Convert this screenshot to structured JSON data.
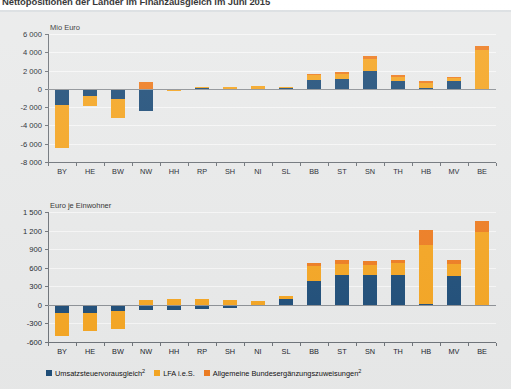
{
  "document": {
    "title": "Nettopositionen der Länder im Finanzausgleich im Juni 2015"
  },
  "legend": {
    "items": [
      {
        "label": "Umsatzsteuervorausgleich",
        "sup": "2",
        "color": "#1f4e79"
      },
      {
        "label": "LFA i.e.S.",
        "sup": "",
        "color": "#f5a623"
      },
      {
        "label": "Allgemeine Bundesergänzungszuweisungen",
        "sup": "2",
        "color": "#ee7d22"
      }
    ]
  },
  "colors": {
    "series_blue": "#1f4e79",
    "series_yellow": "#f5a623",
    "series_orange": "#ee7d22",
    "panel_bg": "#e9eaea",
    "grid": "#f7f7f7",
    "axis": "#6f747a",
    "zero": "#8d9196"
  },
  "chart_data": [
    {
      "id": "chart-mio-euro",
      "type": "bar",
      "stacked": true,
      "title": "",
      "subtitle": "Mio Euro",
      "ylabel": "Mio Euro",
      "xlabel": "",
      "grid": true,
      "legend_position": "bottom",
      "ylim": [
        -8000,
        6000
      ],
      "yticks": [
        6000,
        4000,
        2000,
        0,
        -2000,
        -4000,
        -6000,
        -8000
      ],
      "ytick_labels": [
        "6 000",
        "4 000",
        "2 000",
        "0",
        "-2 000",
        "-4 000",
        "-6 000",
        "-8 000"
      ],
      "categories": [
        "BY",
        "HE",
        "BW",
        "NW",
        "HH",
        "RP",
        "SH",
        "NI",
        "SL",
        "BB",
        "ST",
        "SN",
        "TH",
        "HB",
        "MV",
        "BE"
      ],
      "series": [
        {
          "name": "Umsatzsteuervorausgleich",
          "color": "#1f4e79",
          "values": [
            -1750,
            -750,
            -1100,
            -2450,
            -150,
            40,
            -40,
            -70,
            60,
            950,
            1050,
            1900,
            850,
            80,
            900,
            -20
          ]
        },
        {
          "name": "LFA i.e.S.",
          "color": "#f5a623",
          "values": [
            -4700,
            -1150,
            -2100,
            0,
            -130,
            200,
            190,
            280,
            190,
            520,
            600,
            1350,
            500,
            580,
            300,
            4200
          ]
        },
        {
          "name": "Allgemeine Bundesergänzungszuweisungen",
          "color": "#ee7d22",
          "values": [
            0,
            0,
            0,
            750,
            0,
            0,
            0,
            0,
            0,
            160,
            200,
            380,
            180,
            170,
            120,
            500
          ]
        }
      ]
    },
    {
      "id": "chart-euro-je-einwohner",
      "type": "bar",
      "stacked": true,
      "title": "",
      "subtitle": "Euro je Einwohner",
      "ylabel": "Euro je Einwohner",
      "xlabel": "",
      "grid": true,
      "legend_position": "bottom",
      "ylim": [
        -600,
        1500
      ],
      "yticks": [
        1500,
        1200,
        900,
        600,
        300,
        0,
        -300,
        -600
      ],
      "ytick_labels": [
        "1 500",
        "1 200",
        "900",
        "600",
        "300",
        "0",
        "-300",
        "-600"
      ],
      "categories": [
        "BY",
        "HE",
        "BW",
        "NW",
        "HH",
        "RP",
        "SH",
        "NI",
        "SL",
        "BB",
        "ST",
        "SN",
        "TH",
        "HB",
        "MV",
        "BE"
      ],
      "series": [
        {
          "name": "Umsatzsteuervorausgleich",
          "color": "#1f4e79",
          "values": [
            -135,
            -125,
            -105,
            -85,
            -85,
            -75,
            -45,
            -25,
            95,
            380,
            480,
            475,
            480,
            20,
            465,
            -20
          ]
        },
        {
          "name": "LFA i.e.S.",
          "color": "#f5a623",
          "values": [
            -370,
            -305,
            -280,
            75,
            95,
            90,
            85,
            60,
            55,
            240,
            180,
            175,
            190,
            940,
            200,
            1175
          ]
        },
        {
          "name": "Allgemeine Bundesergänzungszuweisungen",
          "color": "#ee7d22",
          "values": [
            0,
            0,
            0,
            0,
            0,
            0,
            0,
            0,
            0,
            55,
            60,
            60,
            60,
            250,
            60,
            185
          ]
        }
      ]
    }
  ]
}
